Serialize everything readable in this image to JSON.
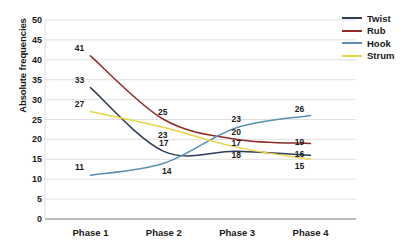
{
  "chart_data": {
    "type": "line",
    "title": "",
    "xlabel": "",
    "ylabel": "Absolute frequencies",
    "categories": [
      "Phase 1",
      "Phase 2",
      "Phase 3",
      "Phase 4"
    ],
    "ylim": [
      0,
      50
    ],
    "ytick_step": 5,
    "yticks": [
      "50",
      "45",
      "40",
      "35",
      "30",
      "25",
      "20",
      "15",
      "10",
      "5",
      "0"
    ],
    "grid": true,
    "legend_position": "top-right",
    "series": [
      {
        "name": "Twist",
        "color": "#2e3a57",
        "values": [
          33,
          17,
          17,
          16
        ]
      },
      {
        "name": "Rub",
        "color": "#8f2b2b",
        "values": [
          41,
          25,
          20,
          19
        ]
      },
      {
        "name": "Hook",
        "color": "#5b8fb4",
        "values": [
          11,
          14,
          23,
          26
        ]
      },
      {
        "name": "Strum",
        "color": "#e8d44a",
        "values": [
          27,
          23,
          18,
          15
        ]
      }
    ],
    "point_labels": [
      {
        "series": "Twist",
        "category": "Phase 1",
        "text": "33"
      },
      {
        "series": "Twist",
        "category": "Phase 2",
        "text": "17"
      },
      {
        "series": "Twist",
        "category": "Phase 3",
        "text": "17"
      },
      {
        "series": "Twist",
        "category": "Phase 4",
        "text": "16"
      },
      {
        "series": "Rub",
        "category": "Phase 1",
        "text": "41"
      },
      {
        "series": "Rub",
        "category": "Phase 2",
        "text": "25"
      },
      {
        "series": "Rub",
        "category": "Phase 3",
        "text": "20"
      },
      {
        "series": "Rub",
        "category": "Phase 4",
        "text": "19"
      },
      {
        "series": "Hook",
        "category": "Phase 1",
        "text": "11"
      },
      {
        "series": "Hook",
        "category": "Phase 2",
        "text": "14"
      },
      {
        "series": "Hook",
        "category": "Phase 3",
        "text": "23"
      },
      {
        "series": "Hook",
        "category": "Phase 4",
        "text": "26"
      },
      {
        "series": "Strum",
        "category": "Phase 1",
        "text": "27"
      },
      {
        "series": "Strum",
        "category": "Phase 2",
        "text": "23"
      },
      {
        "series": "Strum",
        "category": "Phase 3",
        "text": "18"
      },
      {
        "series": "Strum",
        "category": "Phase 4",
        "text": "15"
      }
    ],
    "colors": {
      "grid": "#d8d8d8",
      "axis": "#7a7a7a",
      "text": "#1a1a1a",
      "background": "#ffffff"
    }
  },
  "legend": {
    "items": [
      {
        "label": "Twist"
      },
      {
        "label": "Rub"
      },
      {
        "label": "Hook"
      },
      {
        "label": "Strum"
      }
    ]
  }
}
